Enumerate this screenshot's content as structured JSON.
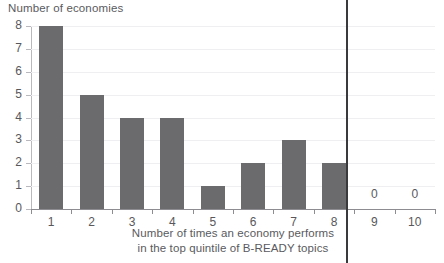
{
  "chart_data": {
    "type": "bar",
    "title": "",
    "ylabel": "Number of economies",
    "xlabel_lines": [
      "Number of times an economy performs",
      "in the top quintile of B-READY topics"
    ],
    "categories": [
      "1",
      "2",
      "3",
      "4",
      "5",
      "6",
      "7",
      "8",
      "9",
      "10"
    ],
    "values": [
      8,
      5,
      4,
      4,
      1,
      2,
      3,
      2,
      0,
      0
    ],
    "value_labels": {
      "9": "0",
      "10": "0"
    },
    "ylim": [
      0,
      8
    ],
    "yticks": [
      "0",
      "1",
      "2",
      "3",
      "4",
      "5",
      "6",
      "7",
      "8"
    ],
    "grid": true,
    "grid_axis": "y",
    "legend": "none",
    "colors": {
      "bar": "#6b6b6d",
      "gridline": "#efeff1",
      "axis": "#8d8d91",
      "text": "#58585b",
      "fold_line": "#3a3a3c",
      "background": "#ffffff"
    }
  },
  "annotations": {
    "fold_line_present": true
  }
}
